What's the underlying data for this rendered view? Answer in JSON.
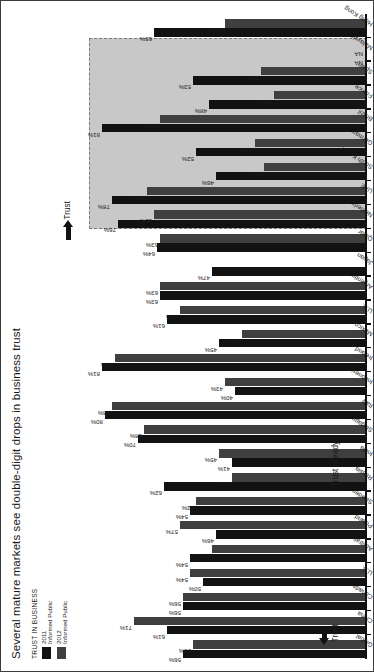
{
  "header": {
    "title": "Several mature markets see double-digit drops in business trust",
    "legend_title": "TRUST IN BUSINESS",
    "legend": [
      {
        "year": "2011",
        "audience": "Informed Public",
        "color": "#121212"
      },
      {
        "year": "2012",
        "audience": "Informed Public",
        "color": "#3f3f3f"
      }
    ]
  },
  "annotations": {
    "trust_left": "Trust",
    "trust_steady": "Trust Steady",
    "trust_right": "Trust",
    "na_label": "NA"
  },
  "colors": {
    "bar_2011": "#121212",
    "bar_2012": "#3f3f3f",
    "shade_panel": "#c8c8c8",
    "axis": "#121212"
  },
  "chart_data": {
    "type": "bar",
    "title": "Several mature markets see double-digit drops in business trust",
    "xlabel": "",
    "ylabel": "Trust in business (% trust)",
    "ylim": [
      0,
      85
    ],
    "grid": false,
    "legend_position": "top-left",
    "categories": [
      "Global",
      "China",
      "Canada",
      "U.S.",
      "Australia",
      "Poland",
      "Sweden",
      "Russia",
      "India",
      "Singapore",
      "Italy",
      "Indonesia",
      "Ireland",
      "Mexico",
      "U.K.",
      "Argentina",
      "Japan",
      "Qatar",
      "Netherlands",
      "UAE",
      "South Korea",
      "Germany",
      "Brazil",
      "France",
      "Spain",
      "Malaysia",
      "Hong Kong"
    ],
    "series": [
      {
        "name": "2011 Informed Public",
        "color": "#121212",
        "values": [
          56,
          61,
          56,
          50,
          54,
          46,
          54,
          62,
          41,
          70,
          80,
          40,
          81,
          45,
          61,
          63,
          47,
          64,
          76,
          78,
          46,
          52,
          81,
          48,
          53,
          null,
          65
        ]
      },
      {
        "name": "2012 Informed Public",
        "color": "#3f3f3f",
        "values": [
          53,
          71,
          56,
          54,
          47,
          57,
          52,
          41,
          45,
          68,
          78,
          43,
          77,
          38,
          57,
          63,
          null,
          63,
          65,
          67,
          31,
          34,
          63,
          28,
          32,
          null,
          43
        ]
      }
    ],
    "groups": [
      {
        "label": "Trust",
        "direction": "up",
        "categories": [
          "China"
        ]
      },
      {
        "label": "Trust Steady",
        "direction": "flat",
        "categories": [
          "Canada",
          "U.S.",
          "Australia",
          "Poland",
          "Sweden",
          "Russia",
          "India",
          "Singapore",
          "Italy",
          "Indonesia",
          "Ireland",
          "Mexico",
          "U.K.",
          "Argentina",
          "Japan",
          "Qatar"
        ]
      },
      {
        "label": "Trust",
        "direction": "down",
        "categories": [
          "Netherlands",
          "UAE",
          "South Korea",
          "Germany",
          "Brazil",
          "France",
          "Spain",
          "Malaysia"
        ]
      }
    ],
    "na_categories": [
      "Malaysia",
      "Japan"
    ]
  }
}
